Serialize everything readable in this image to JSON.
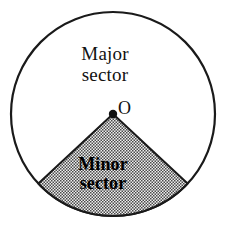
{
  "figure": {
    "major_sector": {
      "line1": "Major",
      "line2": "sector"
    },
    "minor_sector": {
      "line1": "Minor",
      "line2": "sector"
    },
    "center_point": {
      "label": "O"
    },
    "colors": {
      "outline": "#1a1a1a",
      "background": "#ffffff",
      "stipple_dot": "#3a3a3a",
      "stipple_field": "#e8e8e8",
      "text": "#111111"
    },
    "geometry": {
      "circle_center_x": 113,
      "circle_center_y": 114,
      "circle_radius": 102,
      "minor_sector_start_angle_deg": 43,
      "minor_sector_end_angle_deg": 137,
      "minor_sector_sweep_deg": 94,
      "center_dot_radius": 4
    }
  }
}
